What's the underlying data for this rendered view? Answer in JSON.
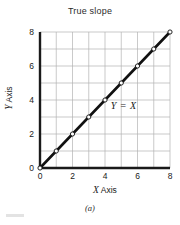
{
  "chart_data": {
    "type": "line",
    "title": "True slope",
    "xlabel": "X Axis",
    "ylabel": "Y Axis",
    "xlabel_italic_prefix": "X",
    "xlabel_rest": " Axis",
    "ylabel_italic_prefix": "Y",
    "ylabel_rest": " Axis",
    "annotation": "Y = X",
    "caption": "(a)",
    "xlim": [
      0,
      8
    ],
    "ylim": [
      0,
      8
    ],
    "grid": true,
    "grid_step": 1,
    "legend": "none",
    "marker": "open-circle",
    "line_color": "#111111",
    "grid_color": "#b3b3b3",
    "axis_color": "#1a1a1a",
    "xticks": [
      0,
      2,
      4,
      6,
      8
    ],
    "yticks": [
      0,
      2,
      4,
      6,
      8
    ],
    "xtick_labels": [
      "0",
      "2",
      "4",
      "6",
      "8"
    ],
    "ytick_labels": [
      "0",
      "2",
      "4",
      "6",
      "8"
    ],
    "series": [
      {
        "name": "Y = X",
        "x": [
          0,
          1,
          2,
          3,
          4,
          5,
          6,
          7,
          8
        ],
        "values": [
          0,
          1,
          2,
          3,
          4,
          5,
          6,
          7,
          8
        ]
      }
    ],
    "annotation_position": {
      "x": 4.35,
      "y": 3.6
    }
  }
}
